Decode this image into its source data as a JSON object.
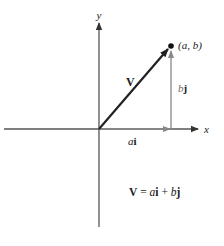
{
  "diagram": {
    "axes": {
      "x_label": "x",
      "y_label": "y"
    },
    "vector": {
      "label": "V",
      "tip_point_label": "(a, b)",
      "color": "#222222"
    },
    "components": {
      "horizontal_label_coef": "a",
      "horizontal_label_unit": "i",
      "vertical_label_coef": "b",
      "vertical_label_unit": "j",
      "color": "#777777"
    },
    "equation": {
      "lhs": "V",
      "equals": " = ",
      "a": "a",
      "i": "i",
      "plus": " + ",
      "b": "b",
      "j": "j"
    },
    "colors": {
      "axis": "#555555",
      "vector": "#222222",
      "component": "#777777",
      "text": "#222222"
    }
  }
}
